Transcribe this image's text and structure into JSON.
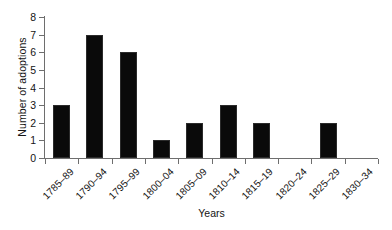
{
  "chart_data": {
    "type": "bar",
    "title": "",
    "subtitle": "",
    "xlabel": "Years",
    "ylabel": "Number of adoptions",
    "categories": [
      "1785–89",
      "1790–94",
      "1795–99",
      "1800–04",
      "1805–09",
      "1810–14",
      "1815–19",
      "1820–24",
      "1825–29",
      "1830–34"
    ],
    "values": [
      3,
      7,
      6,
      1,
      2,
      3,
      2,
      0,
      2,
      0
    ],
    "ylim": [
      0,
      8
    ],
    "ytick_labels": [
      "0",
      "1",
      "2",
      "3",
      "4",
      "5",
      "6",
      "7",
      "8"
    ],
    "ytick_values": [
      0,
      1,
      2,
      3,
      4,
      5,
      6,
      7,
      8
    ],
    "ytick_step": 1,
    "grid": false,
    "legend": false,
    "legend_position": "none",
    "bar_color": "#0a0a0a",
    "axis_color": "#6e6e6e",
    "background_color": "#ffffff",
    "xtick_label_rotation": -45
  }
}
